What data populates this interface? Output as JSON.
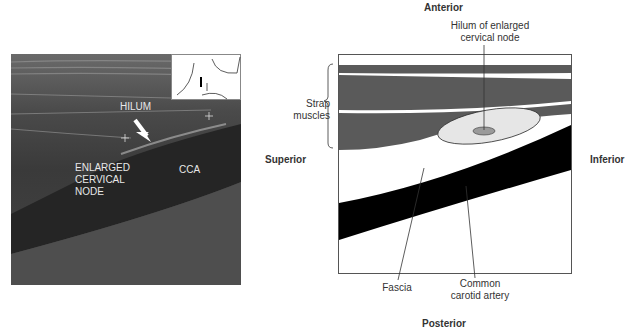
{
  "ultrasound": {
    "labels": {
      "hilum": "HILUM",
      "node_line1": "ENLARGED",
      "node_line2": "CERVICAL",
      "node_line3": "NODE",
      "cca": "CCA"
    },
    "inset_icon": "neck-probe-position-icon"
  },
  "diagram": {
    "directions": {
      "anterior": "Anterior",
      "posterior": "Posterior",
      "superior": "Superior",
      "inferior": "Inferior"
    },
    "labels": {
      "hilum_line1": "Hilum of enlarged",
      "hilum_line2": "cervical node",
      "strap_line1": "Strap",
      "strap_line2": "muscles",
      "fascia": "Fascia",
      "cca_line1": "Common",
      "cca_line2": "carotid artery"
    },
    "colors": {
      "muscle": "#5a5a5a",
      "artery": "#000000",
      "node": "#e6e6e6",
      "hilum": "#9a9a9a"
    }
  }
}
